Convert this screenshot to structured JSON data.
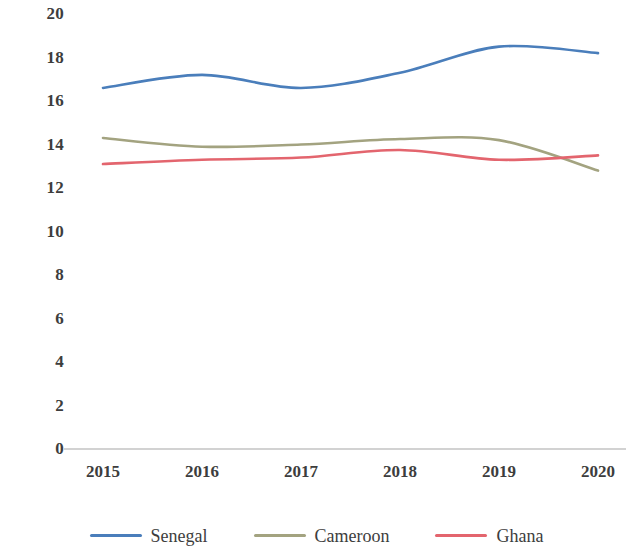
{
  "chart_data": {
    "type": "line",
    "title": "",
    "subtitle": "",
    "xlabel": "",
    "ylabel": "",
    "categories": [
      "2015",
      "2016",
      "2017",
      "2018",
      "2019",
      "2020"
    ],
    "x": [
      2015,
      2016,
      2017,
      2018,
      2019,
      2020
    ],
    "ylim": [
      0,
      20
    ],
    "xlim": [
      2015,
      2020
    ],
    "yticks": [
      "20",
      "18",
      "16",
      "14",
      "12",
      "10",
      "8",
      "6",
      "4",
      "2",
      "0"
    ],
    "ytick_values": [
      20,
      18,
      16,
      14,
      12,
      10,
      8,
      6,
      4,
      2,
      0
    ],
    "grid": false,
    "legend_position": "bottom",
    "smoothing": "spline",
    "series": [
      {
        "name": "Senegal",
        "color": "#4A7EBB",
        "values": [
          16.6,
          17.2,
          16.6,
          17.3,
          18.5,
          18.2
        ]
      },
      {
        "name": "Cameroon",
        "color": "#A3A380",
        "values": [
          14.3,
          13.9,
          14.0,
          14.25,
          14.2,
          12.8
        ]
      },
      {
        "name": "Ghana",
        "color": "#E3656E",
        "values": [
          13.1,
          13.3,
          13.4,
          13.75,
          13.3,
          13.5
        ]
      }
    ]
  },
  "axis": {
    "baseline_color": "#a6a6a6"
  }
}
